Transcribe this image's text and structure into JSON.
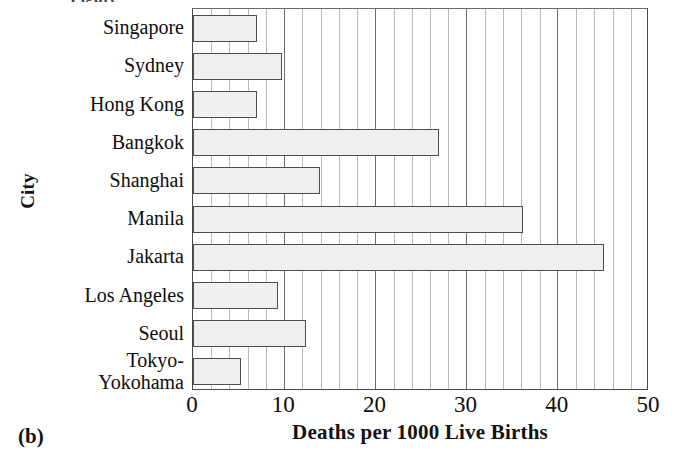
{
  "figure": {
    "caption": "(b)",
    "top_caption_sliver": "Figure"
  },
  "chart_data": {
    "type": "bar",
    "orientation": "horizontal",
    "title": "",
    "xlabel": "Deaths per 1000 Live Births",
    "ylabel": "City",
    "categories": [
      "Singapore",
      "Sydney",
      "Hong Kong",
      "Bangkok",
      "Shanghai",
      "Manila",
      "Jakarta",
      "Los Angeles",
      "Seoul",
      "Tokyo-\nYokohama"
    ],
    "values": [
      7.0,
      9.8,
      7.0,
      27.0,
      13.9,
      36.2,
      45.1,
      9.3,
      12.4,
      5.3
    ],
    "xlim": [
      0,
      50
    ],
    "xticks": [
      0,
      10,
      20,
      30,
      40,
      50
    ],
    "xtick_labels": [
      "0",
      "10",
      "20",
      "30",
      "40",
      "50"
    ],
    "minor_tick_step": 2,
    "grid": "vertical-only",
    "legend": "none",
    "bar_fill_color": "#efefef",
    "bar_edge_color": "#4d4d4d",
    "gridline_color": "#b9b9b9",
    "major_gridline_color": "#6d6d6d",
    "axis_color": "#4a4a4a"
  }
}
